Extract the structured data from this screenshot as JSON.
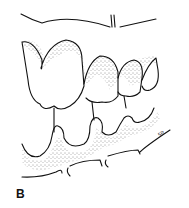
{
  "figure": {
    "panel_label": "B",
    "signature": "5R",
    "colors": {
      "ink": "#111111",
      "background": "#ffffff"
    }
  }
}
